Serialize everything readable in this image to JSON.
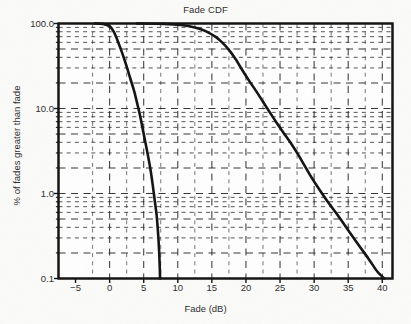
{
  "chart_data": {
    "type": "line",
    "title": "Fade CDF",
    "xlabel": "Fade (dB)",
    "ylabel": "% of fades greater than fade",
    "xlim": [
      -7.5,
      41.5
    ],
    "ylim": [
      0.1,
      100.0
    ],
    "yscale": "log",
    "xscale": "linear",
    "grid": true,
    "grid_style": "dashed",
    "legend": "none",
    "xticks": [
      -5,
      0,
      5,
      10,
      15,
      20,
      25,
      30,
      35,
      40
    ],
    "xtick_labels": [
      "−5",
      "0",
      "5",
      "10",
      "15",
      "20",
      "25",
      "30",
      "35",
      "40"
    ],
    "yticks": [
      100.0,
      10.0,
      1.0,
      0.1
    ],
    "ytick_labels": [
      "100.0",
      "10.0",
      "1.0",
      "0.1"
    ],
    "series": [
      {
        "name": "steep-fade-curve",
        "color": "#111111",
        "points": [
          [
            -2.2,
            100.0
          ],
          [
            -1.0,
            99.0
          ],
          [
            0.0,
            93.0
          ],
          [
            0.6,
            80.0
          ],
          [
            1.2,
            62.0
          ],
          [
            1.8,
            46.0
          ],
          [
            2.4,
            33.0
          ],
          [
            3.0,
            23.0
          ],
          [
            3.6,
            16.0
          ],
          [
            4.1,
            11.0
          ],
          [
            4.5,
            8.0
          ],
          [
            4.9,
            5.5
          ],
          [
            5.3,
            3.8
          ],
          [
            5.7,
            2.6
          ],
          [
            6.0,
            1.9
          ],
          [
            6.3,
            1.3
          ],
          [
            6.6,
            0.85
          ],
          [
            6.9,
            0.55
          ],
          [
            7.1,
            0.35
          ],
          [
            7.25,
            0.22
          ],
          [
            7.35,
            0.14
          ],
          [
            7.4,
            0.1
          ]
        ]
      },
      {
        "name": "shallow-fade-curve",
        "color": "#111111",
        "points": [
          [
            4.0,
            100.0
          ],
          [
            8.0,
            99.0
          ],
          [
            10.5,
            96.0
          ],
          [
            12.5,
            90.0
          ],
          [
            14.0,
            82.0
          ],
          [
            15.5,
            70.0
          ],
          [
            16.5,
            60.0
          ],
          [
            17.5,
            49.0
          ],
          [
            18.5,
            38.0
          ],
          [
            19.5,
            28.0
          ],
          [
            20.5,
            21.0
          ],
          [
            21.5,
            16.0
          ],
          [
            22.5,
            12.0
          ],
          [
            23.5,
            9.0
          ],
          [
            24.5,
            6.8
          ],
          [
            25.5,
            5.2
          ],
          [
            26.5,
            4.0
          ],
          [
            27.5,
            3.0
          ],
          [
            28.5,
            2.2
          ],
          [
            29.5,
            1.6
          ],
          [
            30.5,
            1.2
          ],
          [
            32.0,
            0.8
          ],
          [
            33.5,
            0.55
          ],
          [
            35.0,
            0.37
          ],
          [
            36.5,
            0.25
          ],
          [
            38.0,
            0.17
          ],
          [
            39.3,
            0.12
          ],
          [
            40.3,
            0.1
          ]
        ]
      }
    ]
  },
  "axis_colors": {
    "frame": "#111111",
    "grid": "#222222",
    "text": "#2b2b2b",
    "background": "#fbfbfa"
  }
}
